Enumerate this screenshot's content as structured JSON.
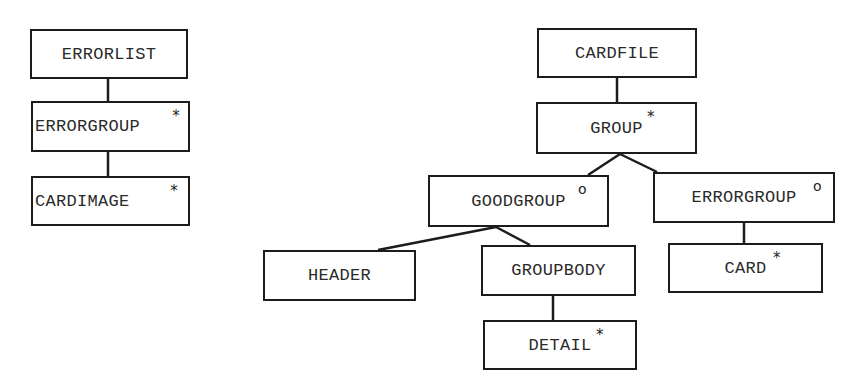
{
  "diagram": {
    "type": "tree",
    "trees": [
      {
        "name": "errorlist-tree",
        "nodes": [
          {
            "id": "errorlist",
            "label": "ERRORLIST",
            "marker": ""
          },
          {
            "id": "errorgroup-left",
            "label": "ERRORGROUP",
            "marker": "*"
          },
          {
            "id": "cardimage",
            "label": "CARDIMAGE",
            "marker": "*"
          }
        ],
        "edges": [
          [
            "errorlist",
            "errorgroup-left"
          ],
          [
            "errorgroup-left",
            "cardimage"
          ]
        ]
      },
      {
        "name": "cardfile-tree",
        "nodes": [
          {
            "id": "cardfile",
            "label": "CARDFILE",
            "marker": ""
          },
          {
            "id": "group",
            "label": "GROUP",
            "marker": "*"
          },
          {
            "id": "goodgroup",
            "label": "GOODGROUP",
            "marker": "o"
          },
          {
            "id": "errorgroup-right",
            "label": "ERRORGROUP",
            "marker": "o"
          },
          {
            "id": "header",
            "label": "HEADER",
            "marker": ""
          },
          {
            "id": "groupbody",
            "label": "GROUPBODY",
            "marker": ""
          },
          {
            "id": "card",
            "label": "CARD",
            "marker": "*"
          },
          {
            "id": "detail",
            "label": "DETAIL",
            "marker": "*"
          }
        ],
        "edges": [
          [
            "cardfile",
            "group"
          ],
          [
            "group",
            "goodgroup"
          ],
          [
            "group",
            "errorgroup-right"
          ],
          [
            "goodgroup",
            "header"
          ],
          [
            "goodgroup",
            "groupbody"
          ],
          [
            "groupbody",
            "detail"
          ],
          [
            "errorgroup-right",
            "card"
          ]
        ]
      }
    ]
  },
  "labels": {
    "errorlist": "ERRORLIST",
    "errorgroup_left": "ERRORGROUP",
    "cardimage": "CARDIMAGE",
    "cardfile": "CARDFILE",
    "group": "GROUP",
    "goodgroup": "GOODGROUP",
    "errorgroup_right": "ERRORGROUP",
    "header": "HEADER",
    "groupbody": "GROUPBODY",
    "card": "CARD",
    "detail": "DETAIL"
  },
  "markers": {
    "iteration": "*",
    "selection": "o"
  }
}
